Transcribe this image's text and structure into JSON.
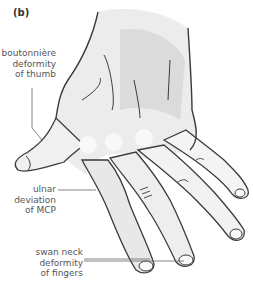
{
  "figure": {
    "panel": "(b)",
    "labels": [
      {
        "id": "thumb",
        "lines": [
          "boutonnière",
          "deformity",
          "of thumb"
        ]
      },
      {
        "id": "mcp",
        "lines": [
          "ulnar",
          "deviation",
          "of MCP"
        ]
      },
      {
        "id": "fingers",
        "lines": [
          "swan neck",
          "deformity",
          "of fingers"
        ]
      }
    ]
  },
  "colors": {
    "outline": "#3a3a3a",
    "skin_light": "#f2f2f2",
    "skin_shade": "#cfcfcf",
    "leader": "#666666",
    "text": "#555555"
  }
}
